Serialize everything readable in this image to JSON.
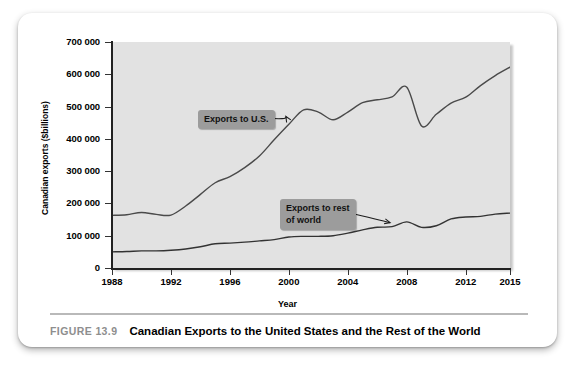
{
  "figure": {
    "number_label": "FIGURE 13.9",
    "title": "Canadian Exports to the United States and the Rest of the World"
  },
  "chart_data": {
    "type": "line",
    "title": "",
    "xlabel": "Year",
    "ylabel": "Canadian exports ($billions)",
    "xlim": [
      1988,
      2015
    ],
    "ylim": [
      0,
      700000
    ],
    "grid": false,
    "legend": "annotations",
    "xticks": [
      "1988",
      "1992",
      "1996",
      "2000",
      "2004",
      "2008",
      "2012",
      "2015"
    ],
    "xtick_values": [
      1988,
      1992,
      1996,
      2000,
      2004,
      2008,
      2012,
      2015
    ],
    "yticks": [
      "0",
      "100 000",
      "200 000",
      "300 000",
      "400 000",
      "500 000",
      "600 000",
      "700 000"
    ],
    "ytick_values": [
      0,
      100000,
      200000,
      300000,
      400000,
      500000,
      600000,
      700000
    ],
    "x": [
      1988,
      1989,
      1990,
      1991,
      1992,
      1993,
      1994,
      1995,
      1996,
      1997,
      1998,
      1999,
      2000,
      2001,
      2002,
      2003,
      2004,
      2005,
      2006,
      2007,
      2008,
      2009,
      2010,
      2011,
      2012,
      2013,
      2014,
      2015
    ],
    "series": [
      {
        "name": "Exports to U.S.",
        "color": "#4a4a4a",
        "values": [
          163000,
          165000,
          172000,
          166000,
          164000,
          192000,
          228000,
          264000,
          283000,
          311000,
          347000,
          397000,
          445000,
          490000,
          483000,
          459000,
          483000,
          512000,
          521000,
          530000,
          560000,
          440000,
          476000,
          511000,
          529000,
          565000,
          596000,
          622000
        ]
      },
      {
        "name": "Exports to rest of world",
        "color": "#333333",
        "values": [
          50000,
          51000,
          53000,
          53000,
          55000,
          59000,
          66000,
          75000,
          77000,
          80000,
          84000,
          88000,
          96000,
          98000,
          98000,
          100000,
          108000,
          118000,
          126000,
          128000,
          143000,
          126000,
          131000,
          152000,
          158000,
          160000,
          167000,
          170000
        ]
      }
    ],
    "annotations": [
      {
        "text": "Exports to U.S.",
        "points_to_year": 2000,
        "points_to_value": 460000
      },
      {
        "text": "Exports to rest\nof world",
        "points_to_year": 2007,
        "points_to_value": 128000
      }
    ]
  }
}
